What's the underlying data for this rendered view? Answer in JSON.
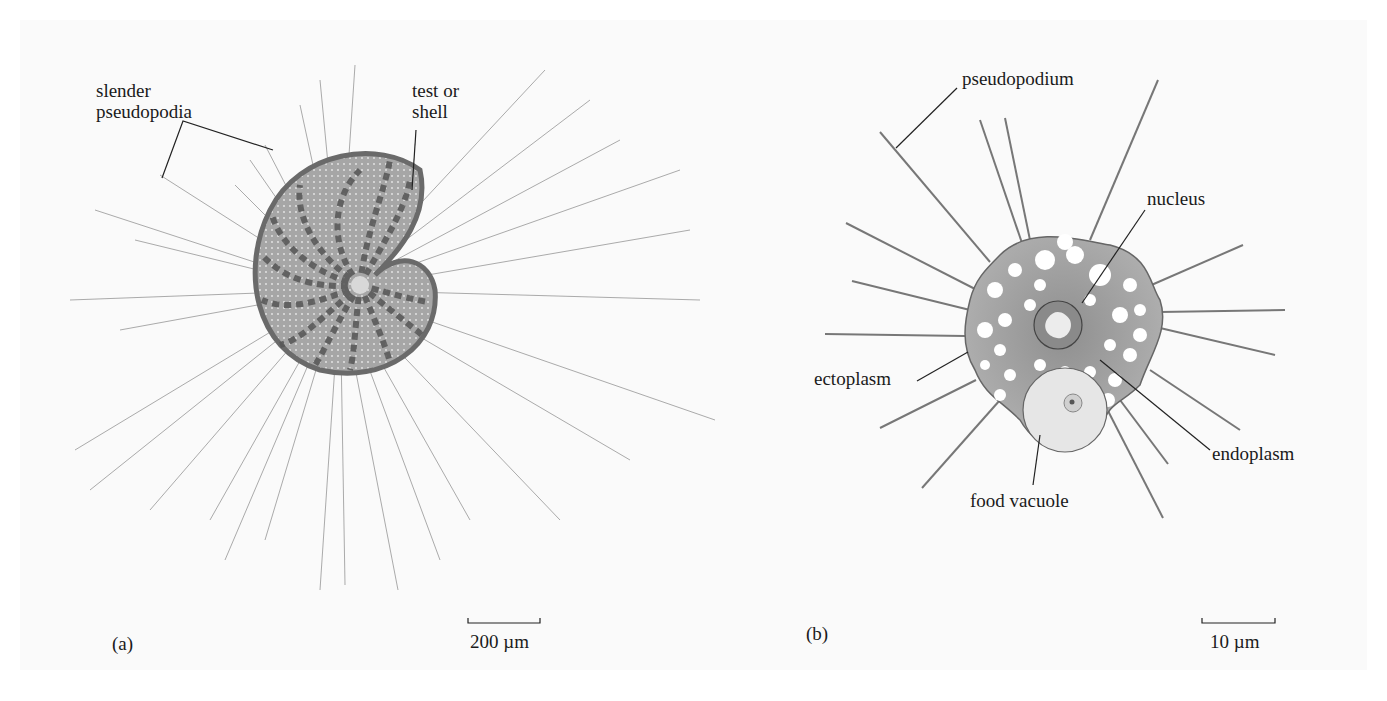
{
  "panel_a": {
    "id": "(a)",
    "labels": {
      "slender_pseudopodia_1": "slender",
      "slender_pseudopodia_2": "pseudopodia",
      "test_or_shell_1": "test or",
      "test_or_shell_2": "shell"
    },
    "scale_bar": "200 µm"
  },
  "panel_b": {
    "id": "(b)",
    "labels": {
      "pseudopodium": "pseudopodium",
      "nucleus": "nucleus",
      "ectoplasm": "ectoplasm",
      "endoplasm": "endoplasm",
      "food_vacuole": "food vacuole"
    },
    "scale_bar": "10 µm"
  },
  "colors": {
    "background": "#fafafa",
    "line": "#333333",
    "pseudopod_line": "#9a9a9a",
    "shell_fill": "#a8a8a8",
    "cell_fill": "#a9a9a9"
  }
}
